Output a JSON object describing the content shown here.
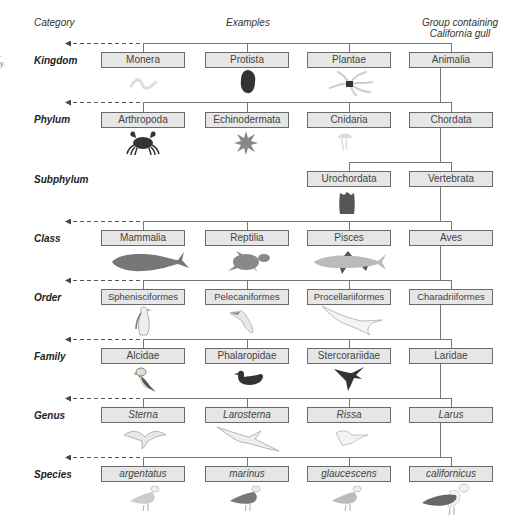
{
  "headers": {
    "category": "Category",
    "examples": "Examples",
    "group_line1": "Group containing",
    "group_line2": "California gull"
  },
  "ranks": [
    {
      "label": "Kingdom",
      "boxes": [
        "Monera",
        "Protista",
        "Plantae",
        "Animalia"
      ]
    },
    {
      "label": "Phylum",
      "boxes": [
        "Arthropoda",
        "Echinodermata",
        "Cnidaria",
        "Chordata"
      ]
    },
    {
      "label": "Subphylum",
      "boxes": [
        "",
        "",
        "Urochordata",
        "Vertebrata"
      ]
    },
    {
      "label": "Class",
      "boxes": [
        "Mammalia",
        "Reptilia",
        "Pisces",
        "Aves"
      ]
    },
    {
      "label": "Order",
      "boxes": [
        "Sphenisciformes",
        "Pelecaniformes",
        "Procellariiformes",
        "Charadriiformes"
      ]
    },
    {
      "label": "Family",
      "boxes": [
        "Alcidae",
        "Phalaropidae",
        "Stercorariidae",
        "Laridae"
      ]
    },
    {
      "label": "Genus",
      "boxes": [
        "Sterna",
        "Larosterna",
        "Rissa",
        "Larus"
      ]
    },
    {
      "label": "Species",
      "boxes": [
        "argentatus",
        "marinus",
        "glaucescens",
        "californicus"
      ]
    }
  ],
  "illustrations": [
    "bacterium-icon",
    "protist-icon",
    "plant-icon",
    "crab-icon",
    "starfish-icon",
    "jellyfish-icon",
    "tunicate-icon",
    "whale-icon",
    "turtle-icon",
    "fish-icon",
    "penguin-icon",
    "pelican-icon",
    "albatross-icon",
    "puffin-icon",
    "phalarope-icon",
    "skua-icon",
    "tern-icon",
    "inca-tern-icon",
    "kittiwake-icon",
    "herring-gull-icon",
    "black-backed-gull-icon",
    "glaucous-winged-gull-icon",
    "california-gull-icon"
  ],
  "colors": {
    "box_fill": "#e6e6e6",
    "box_border": "#6a6a6a",
    "line": "#777777",
    "dark_silhouette": "#3a3a3a",
    "mid_silhouette": "#7a7a7a"
  }
}
